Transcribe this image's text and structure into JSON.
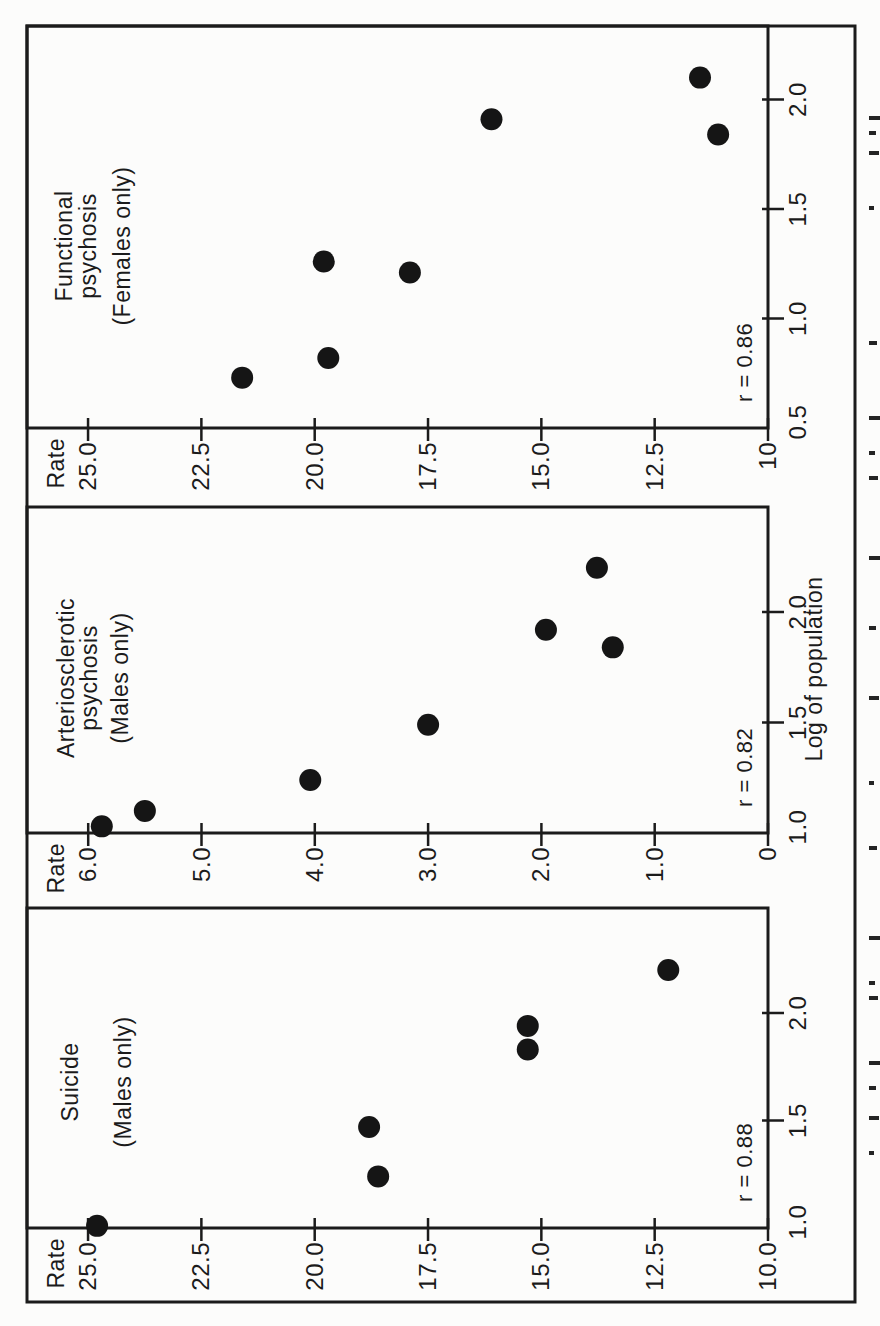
{
  "figure": {
    "shared_x_label": "Log of population",
    "y_axis_heading": "Rate"
  },
  "chart_data": [
    {
      "type": "scatter",
      "panel": "suicide",
      "title_lines": [
        "Suicide",
        "(Males only)"
      ],
      "correlation_label": "r = 0.88",
      "ylabel": "Rate",
      "xlabel": "Log of population",
      "xlim": [
        1.0,
        2.49
      ],
      "ylim": [
        10.0,
        26.3
      ],
      "grid": false,
      "x_tick_values": [
        1.0,
        1.5,
        2.0
      ],
      "x_tick_labels": [
        "1.0",
        "1.5",
        "2.0"
      ],
      "y_tick_values": [
        25.0,
        22.5,
        20.0,
        17.5,
        15.0,
        12.5,
        10.0
      ],
      "y_tick_labels": [
        "25.0",
        "22.5",
        "20.0",
        "17.5",
        "15.0",
        "12.5",
        "10.0"
      ],
      "points": [
        [
          1.01,
          24.8
        ],
        [
          1.24,
          18.6
        ],
        [
          1.47,
          18.8
        ],
        [
          1.83,
          15.3
        ],
        [
          1.94,
          15.3
        ],
        [
          2.2,
          12.2
        ]
      ]
    },
    {
      "type": "scatter",
      "panel": "arteriosclerotic-psychosis",
      "title_lines": [
        "Arteriosclerotic",
        "psychosis",
        "(Males only)"
      ],
      "correlation_label": "r = 0.82",
      "ylabel": "Rate",
      "xlabel": "Log of population",
      "xlim": [
        1.0,
        2.48
      ],
      "ylim": [
        0.0,
        6.5
      ],
      "grid": false,
      "x_tick_values": [
        1.0,
        1.5,
        2.0
      ],
      "x_tick_labels": [
        "1.0",
        "1.5",
        "2.0"
      ],
      "y_tick_values": [
        6.0,
        5.0,
        4.0,
        3.0,
        2.0,
        1.0,
        0.0
      ],
      "y_tick_labels": [
        "6.0",
        "5.0",
        "4.0",
        "3.0",
        "2.0",
        "1.0",
        "0"
      ],
      "points": [
        [
          1.03,
          5.88
        ],
        [
          1.1,
          5.5
        ],
        [
          1.24,
          4.04
        ],
        [
          1.49,
          3.0
        ],
        [
          1.84,
          1.37
        ],
        [
          1.92,
          1.96
        ],
        [
          2.2,
          1.51
        ]
      ]
    },
    {
      "type": "scatter",
      "panel": "functional-psychosis",
      "title_lines": [
        "Functional",
        "psychosis",
        "(Females only)"
      ],
      "correlation_label": "r = 0.86",
      "ylabel": "Rate",
      "xlabel": "Log of population",
      "xlim": [
        0.5,
        2.34
      ],
      "ylim": [
        10.0,
        26.3
      ],
      "grid": false,
      "x_tick_values": [
        0.5,
        1.0,
        1.5,
        2.0
      ],
      "x_tick_labels": [
        "0.5",
        "1.0",
        "1.5",
        "2.0"
      ],
      "y_tick_values": [
        25.0,
        22.5,
        20.0,
        17.5,
        15.0,
        12.5,
        10.0
      ],
      "y_tick_labels": [
        "25.0",
        "22.5",
        "20.0",
        "17.5",
        "15.0",
        "12.5",
        "10"
      ],
      "points": [
        [
          0.73,
          21.6
        ],
        [
          0.82,
          19.7
        ],
        [
          1.21,
          17.9
        ],
        [
          1.26,
          19.8
        ],
        [
          1.84,
          11.1
        ],
        [
          1.91,
          16.1
        ],
        [
          2.1,
          11.5
        ]
      ]
    }
  ],
  "cropped_caption": {
    "visible": true,
    "legible": false,
    "fragment_positions": [
      171,
      206,
      236,
      261,
      326,
      341,
      386,
      476,
      541,
      626,
      696,
      766,
      846,
      871,
      906,
      981,
      1116,
      1171,
      1191,
      1206
    ]
  }
}
